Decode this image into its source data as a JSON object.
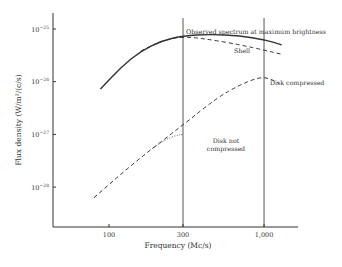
{
  "chart_data": {
    "type": "line",
    "title": "",
    "xlabel": "Frequency (Mc/s)",
    "ylabel": "Flux density (W/m²/(c/s)",
    "x_scale": "log",
    "y_scale": "log",
    "xlim": [
      60,
      1600
    ],
    "ylim": [
      1e-28,
      1e-25
    ],
    "x_ticks": [
      {
        "value": 100,
        "label": "100"
      },
      {
        "value": 300,
        "label": "300"
      },
      {
        "value": 1000,
        "label": "1,000"
      }
    ],
    "y_ticks": [
      {
        "exp": -25,
        "label": "10",
        "sup": "−25"
      },
      {
        "exp": -26,
        "label": "10",
        "sup": "−26"
      },
      {
        "exp": -27,
        "label": "10",
        "sup": "−27"
      },
      {
        "exp": -28,
        "label": "10",
        "sup": "−28"
      }
    ],
    "vertical_reference_lines": [
      300,
      1000
    ],
    "grid": false,
    "legend": "inline labels",
    "series": [
      {
        "name": "Observed spectrum at maximum brightness",
        "style": "solid",
        "points_log10": [
          [
            88,
            -26.14
          ],
          [
            120,
            -25.72
          ],
          [
            160,
            -25.42
          ],
          [
            220,
            -25.22
          ],
          [
            300,
            -25.13
          ],
          [
            450,
            -25.1
          ],
          [
            700,
            -25.13
          ],
          [
            1000,
            -25.2
          ],
          [
            1300,
            -25.3
          ]
        ]
      },
      {
        "name": "Shell",
        "style": "dashed",
        "points_log10": [
          [
            160,
            -25.42
          ],
          [
            220,
            -25.22
          ],
          [
            300,
            -25.14
          ],
          [
            450,
            -25.2
          ],
          [
            700,
            -25.3
          ],
          [
            1000,
            -25.4
          ],
          [
            1300,
            -25.48
          ]
        ]
      },
      {
        "name": "Disk compressed",
        "style": "dashed",
        "points_log10": [
          [
            80,
            -28.2
          ],
          [
            150,
            -27.5
          ],
          [
            300,
            -26.82
          ],
          [
            500,
            -26.3
          ],
          [
            700,
            -26.06
          ],
          [
            900,
            -25.93
          ],
          [
            1050,
            -25.92
          ],
          [
            1250,
            -26.03
          ]
        ]
      },
      {
        "name": "Disk not compressed",
        "style": "dotted",
        "points_log10": [
          [
            190,
            -27.27
          ],
          [
            230,
            -27.1
          ],
          [
            270,
            -27.02
          ],
          [
            300,
            -27.0
          ]
        ]
      }
    ],
    "annotations": [
      {
        "text": "Observed spectrum at maximum brightness",
        "x": 186,
        "y": 34
      },
      {
        "text": "Shell",
        "x": 234,
        "y": 53
      },
      {
        "text": "Disk compressed",
        "x": 270,
        "y": 85
      },
      {
        "text": "Disk not",
        "x": 226,
        "y": 143
      },
      {
        "text": "compressed",
        "x": 226,
        "y": 151
      }
    ]
  }
}
